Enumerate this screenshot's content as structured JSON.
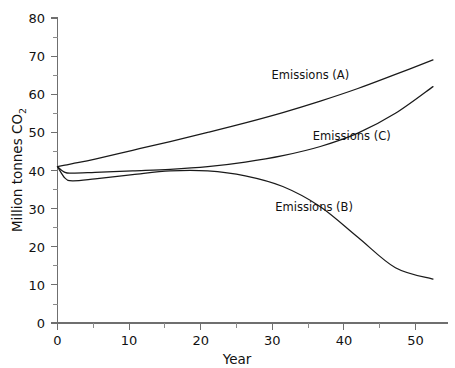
{
  "chart_data": {
    "type": "line",
    "title": "",
    "xlabel": "Year",
    "ylabel": "Million tonnes CO2",
    "ylabel_main": "Million tonnes CO",
    "ylabel_subscript": "2",
    "xlim": [
      0,
      52
    ],
    "ylim": [
      0,
      80
    ],
    "grid": false,
    "legend_position": "inline-annotations",
    "x_ticks": [
      0,
      10,
      20,
      30,
      40,
      50
    ],
    "x_tick_labels": [
      "0",
      "10",
      "20",
      "30",
      "40",
      "50"
    ],
    "x_minor_ticks": [
      5,
      15,
      25,
      35,
      45
    ],
    "y_ticks": [
      0,
      10,
      20,
      30,
      40,
      50,
      60,
      70,
      80
    ],
    "y_tick_labels": [
      "0",
      "10",
      "20",
      "30",
      "40",
      "50",
      "60",
      "70",
      "80"
    ],
    "y_minor_ticks": [
      5,
      15,
      25,
      35,
      45,
      55,
      65,
      75
    ],
    "x": [
      0,
      1,
      2,
      5,
      10,
      15,
      20,
      25,
      30,
      35,
      40,
      45,
      50
    ],
    "series": [
      {
        "name": "Emissions (A)",
        "label": "Emissions (A)",
        "values": [
          41.0,
          41.4,
          41.8,
          43.0,
          45.3,
          47.6,
          50.0,
          52.5,
          55.2,
          58.2,
          61.5,
          65.2,
          69.0
        ],
        "annotation": {
          "text": "Emissions (A)",
          "x": 28.5,
          "y": 64.0
        }
      },
      {
        "name": "Emissions (B)",
        "label": "Emissions (B)",
        "values": [
          41.0,
          38.0,
          37.3,
          37.8,
          38.9,
          39.9,
          39.9,
          38.6,
          35.8,
          30.5,
          22.5,
          14.5,
          11.5
        ],
        "annotation": {
          "text": "Emissions (B)",
          "x": 29.0,
          "y": 29.5
        }
      },
      {
        "name": "Emissions (C)",
        "label": "Emissions (C)",
        "values": [
          41.0,
          39.5,
          39.3,
          39.5,
          39.9,
          40.3,
          41.0,
          42.2,
          43.9,
          46.3,
          49.8,
          55.0,
          62.0
        ],
        "annotation": {
          "text": "Emissions (C)",
          "x": 34.0,
          "y": 48.0
        }
      }
    ]
  },
  "axis": {
    "x_title": "Year",
    "y_title_main": "Million tonnes CO",
    "y_title_sub": "2"
  },
  "colors": {
    "background": "#ffffff",
    "axis": "#6f6f6f",
    "line": "#1a1a1a",
    "text": "#111111"
  }
}
